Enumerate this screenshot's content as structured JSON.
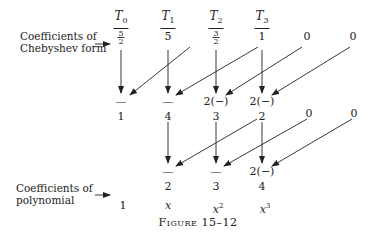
{
  "labels": {
    "chebyshev_line1": "Coefficients of",
    "chebyshev_line2": "Chebyshev form",
    "poly_line1": "Coefficients of",
    "poly_line2": "polynomial"
  },
  "headers": {
    "t0": "T",
    "t0_sub": "0",
    "t1": "T",
    "t1_sub": "1",
    "t2": "T",
    "t2_sub": "2",
    "t3": "T",
    "t3_sub": "3"
  },
  "row1": {
    "c0_num": "5",
    "c0_den": "2",
    "c1": "5",
    "c2_num": "3",
    "c2_den": "2",
    "c3": "1",
    "c4": "0",
    "c5": "0"
  },
  "ops1": {
    "c0": "—",
    "c1": "—",
    "c2": "2(−)",
    "c3": "2(−)"
  },
  "row2": {
    "c0": "1",
    "c1": "4",
    "c2": "3",
    "c3": "2",
    "c4": "0",
    "c5": "0"
  },
  "ops2": {
    "c1": "—",
    "c2": "—",
    "c3": "2(−)"
  },
  "row3": {
    "c1": "2",
    "c2": "3",
    "c3": "4"
  },
  "powers": {
    "c0": "1",
    "c1": "x",
    "c2": "x",
    "c2_sup": "2",
    "c3": "x",
    "c3_sup": "3"
  },
  "caption": {
    "prefix": "Figure",
    "number": "15–12"
  }
}
